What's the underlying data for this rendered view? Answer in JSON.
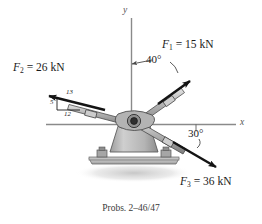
{
  "figure": {
    "caption": "Probs. 2–46/47",
    "axes": {
      "y_label": "y",
      "x_label": "x"
    },
    "colors": {
      "arrow": "#141414",
      "axis": "#8a8a8a",
      "rod_fill": "#b9b9b9",
      "rod_stroke": "#4a4a4a",
      "pedestal_fill": "#bdbdbd",
      "pedestal_stroke": "#585858",
      "base_fill": "#c9c9c9",
      "bolt_fill": "#9a9a9a",
      "shadow": "#d6d6d6",
      "text": "#1a1a1a"
    },
    "forces": [
      {
        "id": "F1",
        "name": "F",
        "subscript": "1",
        "equals": "=",
        "magnitude": "15",
        "unit": "kN",
        "label": "F₁ = 15 kN",
        "angle_label": "40°",
        "angle_reference": "from y-axis, toward +x",
        "direction": "up-right"
      },
      {
        "id": "F2",
        "name": "F",
        "subscript": "2",
        "equals": "=",
        "magnitude": "26",
        "unit": "kN",
        "label": "F₂ = 26 kN",
        "slope": {
          "hypotenuse": "13",
          "vertical": "5",
          "horizontal": "12"
        },
        "direction": "up-left"
      },
      {
        "id": "F3",
        "name": "F",
        "subscript": "3",
        "equals": "=",
        "magnitude": "36",
        "unit": "kN",
        "label": "F₃ = 36 kN",
        "angle_label": "30°",
        "angle_reference": "below x-axis",
        "direction": "down-right"
      }
    ]
  }
}
